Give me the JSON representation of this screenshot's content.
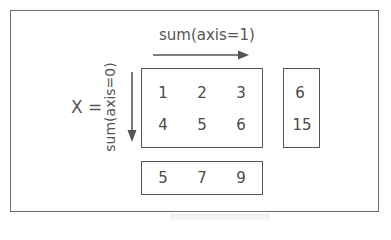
{
  "diagram": {
    "variable_label": "X =",
    "row_sum_label": "sum(axis=1)",
    "col_sum_label": "sum(axis=0)",
    "matrix": [
      [
        1,
        2,
        3
      ],
      [
        4,
        5,
        6
      ]
    ],
    "matrix_text": {
      "r0c0": "1",
      "r0c1": "2",
      "r0c2": "3",
      "r1c0": "4",
      "r1c1": "5",
      "r1c2": "6"
    },
    "row_sums": [
      "6",
      "15"
    ],
    "col_sums": [
      "5",
      "7",
      "9"
    ],
    "colors": {
      "stroke": "#555555",
      "text": "#4a4a4a",
      "background": "#ffffff"
    }
  }
}
